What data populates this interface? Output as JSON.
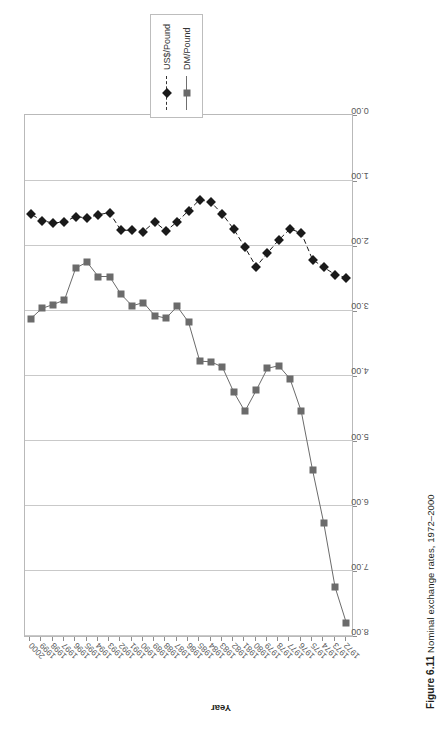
{
  "figure": {
    "number": "Figure 6.11",
    "caption": "Nominal exchange rates, 1972–2000"
  },
  "legend": {
    "position": "right",
    "items": [
      {
        "label": "US$/Pound",
        "marker": "diamond",
        "color": "#1a1a1a",
        "line": "dashed"
      },
      {
        "label": "DM/Pound",
        "marker": "square",
        "color": "#6b6b6b",
        "line": "solid"
      }
    ]
  },
  "axes": {
    "x_title": "",
    "y_title": "Year",
    "value_ticks": [
      "8.00",
      "7.00",
      "6.00",
      "5.00",
      "4.00",
      "3.00",
      "2.00",
      "1.00",
      "0.00"
    ],
    "value_min": 0.0,
    "value_max": 8.0,
    "grid": true
  },
  "chart_data": {
    "type": "line",
    "title": "Nominal exchange rates, 1972–2000",
    "xlabel": "Year",
    "ylabel": "",
    "orientation": "horizontal",
    "ylim": [
      0.0,
      8.0
    ],
    "grid": true,
    "legend_position": "right",
    "categories": [
      "1972",
      "1973",
      "1974",
      "1975",
      "1976",
      "1977",
      "1978",
      "1979",
      "1980",
      "1981",
      "1982",
      "1983",
      "1984",
      "1985",
      "1986",
      "1987",
      "1988",
      "1989",
      "1990",
      "1991",
      "1992",
      "1993",
      "1994",
      "1995",
      "1996",
      "1997",
      "1998",
      "1999",
      "2000"
    ],
    "series": [
      {
        "name": "US$/Pound",
        "marker": "diamond",
        "line": "dashed",
        "color": "#1a1a1a",
        "values": [
          2.5,
          2.45,
          2.34,
          2.22,
          1.81,
          1.75,
          1.92,
          2.12,
          2.33,
          2.03,
          1.75,
          1.52,
          1.34,
          1.3,
          1.47,
          1.64,
          1.78,
          1.64,
          1.79,
          1.77,
          1.77,
          1.5,
          1.53,
          1.58,
          1.56,
          1.64,
          1.66,
          1.62,
          1.52
        ]
      },
      {
        "name": "DM/Pound",
        "marker": "square",
        "line": "solid",
        "color": "#6b6b6b",
        "values": [
          7.8,
          7.25,
          6.27,
          5.45,
          4.55,
          4.05,
          3.85,
          3.89,
          4.23,
          4.55,
          4.25,
          3.87,
          3.79,
          3.78,
          3.18,
          2.94,
          3.12,
          3.08,
          2.88,
          2.93,
          2.75,
          2.48,
          2.48,
          2.26,
          2.35,
          2.84,
          2.91,
          2.97,
          3.13
        ]
      }
    ]
  }
}
